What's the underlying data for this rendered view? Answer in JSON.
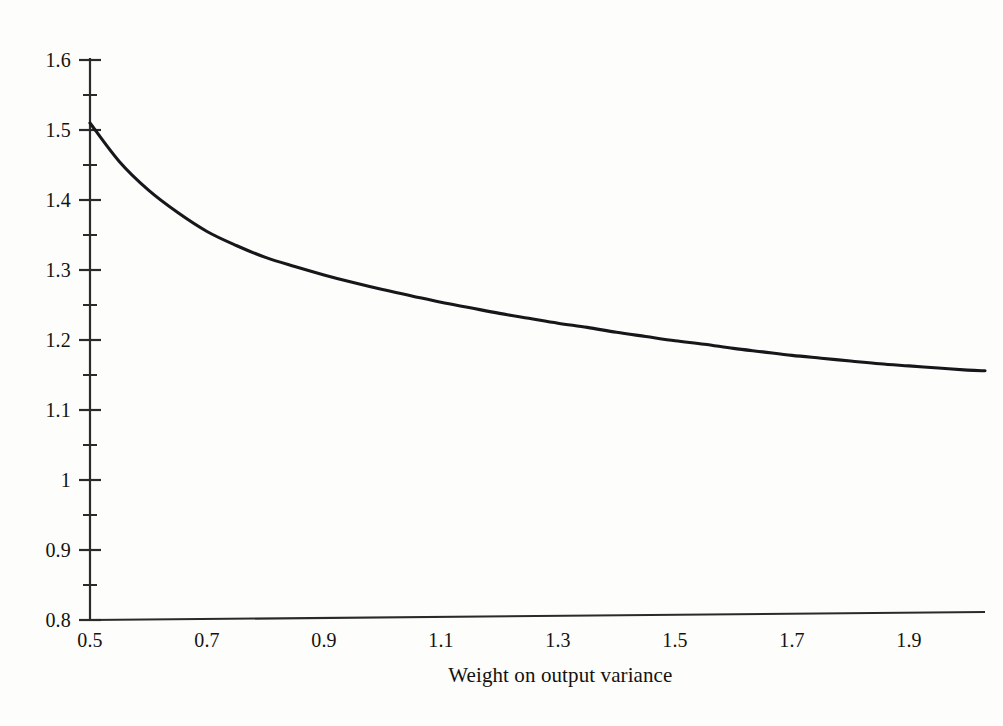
{
  "figure": {
    "background_color": "#fdfdfb",
    "line_color": "#17161a",
    "axis_color": "#2a2a2a"
  },
  "chart_data": {
    "type": "line",
    "title": "",
    "subtitle": "",
    "xlabel": "Weight on output variance",
    "ylabel": "",
    "xlim": [
      0.5,
      2.05
    ],
    "ylim": [
      0.8,
      1.6
    ],
    "grid": false,
    "legend": null,
    "legend_position": "none",
    "xticks": [
      0.5,
      0.7,
      0.9,
      1.1,
      1.3,
      1.5,
      1.7,
      1.9
    ],
    "xtick_labels": [
      "0.5",
      "0.7",
      "0.9",
      "1.1",
      "1.3",
      "1.5",
      "1.7",
      "1.9"
    ],
    "yticks": [
      0.8,
      0.9,
      1.0,
      1.1,
      1.2,
      1.3,
      1.4,
      1.5,
      1.6
    ],
    "ytick_labels": [
      "0.8",
      "0.9",
      "1",
      "1.1",
      "1.2",
      "1.3",
      "1.4",
      "1.5",
      "1.6"
    ],
    "yticks_minor": [
      0.85,
      0.95,
      1.05,
      1.15,
      1.25,
      1.35,
      1.45,
      1.55
    ],
    "x": [
      0.5,
      0.55,
      0.6,
      0.65,
      0.7,
      0.75,
      0.8,
      0.85,
      0.9,
      0.95,
      1.0,
      1.05,
      1.1,
      1.15,
      1.2,
      1.25,
      1.3,
      1.35,
      1.4,
      1.45,
      1.5,
      1.55,
      1.6,
      1.65,
      1.7,
      1.75,
      1.8,
      1.85,
      1.9,
      1.95,
      2.0,
      2.03
    ],
    "y": [
      1.51,
      1.455,
      1.414,
      1.382,
      1.355,
      1.335,
      1.318,
      1.305,
      1.293,
      1.282,
      1.272,
      1.263,
      1.254,
      1.246,
      1.238,
      1.231,
      1.224,
      1.218,
      1.211,
      1.205,
      1.199,
      1.194,
      1.188,
      1.183,
      1.178,
      1.174,
      1.17,
      1.166,
      1.163,
      1.16,
      1.157,
      1.156
    ],
    "series": [
      {
        "name": "expected loss",
        "values": [
          1.51,
          1.455,
          1.414,
          1.382,
          1.355,
          1.335,
          1.318,
          1.305,
          1.293,
          1.282,
          1.272,
          1.263,
          1.254,
          1.246,
          1.238,
          1.231,
          1.224,
          1.218,
          1.211,
          1.205,
          1.199,
          1.194,
          1.188,
          1.183,
          1.178,
          1.174,
          1.17,
          1.166,
          1.163,
          1.16,
          1.157,
          1.156
        ]
      }
    ]
  }
}
